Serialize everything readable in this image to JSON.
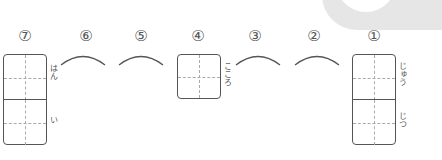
{
  "score": {
    "text": "/ 7"
  },
  "numbers": [
    "⑦",
    "⑥",
    "⑤",
    "④",
    "③",
    "②",
    "①"
  ],
  "boxes": {
    "q7": {
      "furigana_top": "はん",
      "furigana_bottom": "い"
    },
    "q4": {
      "furigana": "こころ"
    },
    "q1": {
      "furigana_top": "じゅう",
      "furigana_bottom": "じつ"
    }
  },
  "colors": {
    "stroke": "#555555",
    "guide": "#aaaaaa",
    "tab": "#e6e6e6"
  }
}
